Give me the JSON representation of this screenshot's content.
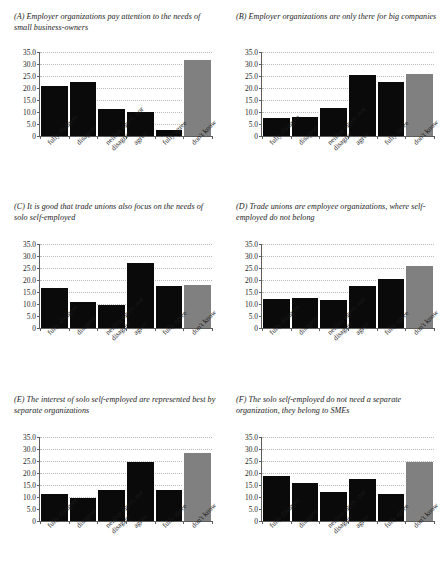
{
  "figure": {
    "background": "#ffffff",
    "bar_color_dark": "#0a0a0a",
    "bar_color_gray": "#808080",
    "gridline_color": "#b9b9b9",
    "axis_color": "#5d5d5d"
  },
  "chart_data": [
    {
      "type": "bar",
      "panel": "A",
      "tag": "(A)",
      "title": "(A) Employer organizations pay attention to the needs of small business-owners",
      "title_text": "Employer organizations pay attention to the needs of small business-owners",
      "categories": [
        "fully disagree",
        "disagree",
        "neither agree, nor disagree",
        "agree",
        "fully agree",
        "don't know"
      ],
      "values": [
        21.0,
        22.4,
        11.4,
        10.2,
        2.7,
        31.5
      ],
      "bar_colors": [
        "#0a0a0a",
        "#0a0a0a",
        "#0a0a0a",
        "#0a0a0a",
        "#0a0a0a",
        "#808080"
      ],
      "xlabel": "",
      "ylabel": "",
      "ylim": [
        0,
        35
      ],
      "yticks": [
        "0",
        "5.0",
        "10.0",
        "15.0",
        "20.0",
        "25.0",
        "30.0",
        "35.0"
      ],
      "ytick_values": [
        0,
        5,
        10,
        15,
        20,
        25,
        30,
        35
      ],
      "grid": true,
      "legend": "none"
    },
    {
      "type": "bar",
      "panel": "B",
      "tag": "(B)",
      "title": "(B) Employer organizations are only there for big companies",
      "title_text": "Employer organizations are only there for big companies",
      "categories": [
        "fully disagree",
        "disagree",
        "neither agree, nor disagree",
        "agree",
        "fully agree",
        "don't know"
      ],
      "values": [
        7.3,
        7.8,
        11.5,
        25.5,
        22.3,
        25.8
      ],
      "bar_colors": [
        "#0a0a0a",
        "#0a0a0a",
        "#0a0a0a",
        "#0a0a0a",
        "#0a0a0a",
        "#808080"
      ],
      "xlabel": "",
      "ylabel": "",
      "ylim": [
        0,
        35
      ],
      "yticks": [
        "0",
        "5.0",
        "10.0",
        "15.0",
        "20.0",
        "25.0",
        "30.0",
        "35.0"
      ],
      "ytick_values": [
        0,
        5,
        10,
        15,
        20,
        25,
        30,
        35
      ],
      "grid": true,
      "legend": "none"
    },
    {
      "type": "bar",
      "panel": "C",
      "tag": "(C)",
      "title": "(C) It is good that trade unions also focus on the needs of solo self-employed",
      "title_text": "It is good that trade unions also focus on the needs of solo self-employed",
      "categories": [
        "fully disagree",
        "disagree",
        "neither agree, nor disagree",
        "agree",
        "fully agree",
        "don't know"
      ],
      "values": [
        16.6,
        10.8,
        9.4,
        27.2,
        17.6,
        17.9
      ],
      "bar_colors": [
        "#0a0a0a",
        "#0a0a0a",
        "#0a0a0a",
        "#0a0a0a",
        "#0a0a0a",
        "#808080"
      ],
      "xlabel": "",
      "ylabel": "",
      "ylim": [
        0,
        35
      ],
      "yticks": [
        "0",
        "5.0",
        "10.0",
        "15.0",
        "20.0",
        "25.0",
        "30.0",
        "35.0"
      ],
      "ytick_values": [
        0,
        5,
        10,
        15,
        20,
        25,
        30,
        35
      ],
      "grid": true,
      "legend": "none"
    },
    {
      "type": "bar",
      "panel": "D",
      "tag": "(D)",
      "title": "(D) Trade unions are employee organizations, where self-employed do not belong",
      "title_text": "Trade unions are employee organizations, where self-employed do not belong",
      "categories": [
        "fully disagree",
        "disagree",
        "neither agree, nor disagree",
        "agree",
        "fully agree",
        "don't know"
      ],
      "values": [
        12.2,
        12.7,
        11.7,
        17.6,
        20.3,
        25.8
      ],
      "bar_colors": [
        "#0a0a0a",
        "#0a0a0a",
        "#0a0a0a",
        "#0a0a0a",
        "#0a0a0a",
        "#808080"
      ],
      "xlabel": "",
      "ylabel": "",
      "ylim": [
        0,
        35
      ],
      "yticks": [
        "0",
        "5.0",
        "10.0",
        "15.0",
        "20.0",
        "25.0",
        "30.0",
        "35.0"
      ],
      "ytick_values": [
        0,
        5,
        10,
        15,
        20,
        25,
        30,
        35
      ],
      "grid": true,
      "legend": "none"
    },
    {
      "type": "bar",
      "panel": "E",
      "tag": "(E)",
      "title": "(E) The interest of solo self-employed are represented best by separate organizations",
      "title_text": "The interest of solo self-employed are represented best by separate organizations",
      "categories": [
        "fully disagree",
        "disagree",
        "neither agree, nor disagree",
        "agree",
        "fully agree",
        "don't know"
      ],
      "values": [
        11.3,
        9.4,
        12.8,
        24.6,
        13.1,
        28.3
      ],
      "bar_colors": [
        "#0a0a0a",
        "#0a0a0a",
        "#0a0a0a",
        "#0a0a0a",
        "#0a0a0a",
        "#808080"
      ],
      "xlabel": "",
      "ylabel": "",
      "ylim": [
        0,
        35
      ],
      "yticks": [
        "0",
        "5.0",
        "10.0",
        "15.0",
        "20.0",
        "25.0",
        "30.0",
        "35.0"
      ],
      "ytick_values": [
        0,
        5,
        10,
        15,
        20,
        25,
        30,
        35
      ],
      "grid": true,
      "legend": "none"
    },
    {
      "type": "bar",
      "panel": "F",
      "tag": "(F)",
      "title": "(F) The solo self-employed do not need a separate organization, they belong to SMEs",
      "title_text": "The solo self-employed do not need a separate organization, they belong to SMEs",
      "categories": [
        "fully disagree",
        "disagree",
        "neither agree, nor disagree",
        "agree",
        "fully agree",
        "don't know"
      ],
      "values": [
        18.8,
        15.8,
        12.0,
        17.6,
        11.4,
        24.4
      ],
      "bar_colors": [
        "#0a0a0a",
        "#0a0a0a",
        "#0a0a0a",
        "#0a0a0a",
        "#0a0a0a",
        "#808080"
      ],
      "xlabel": "",
      "ylabel": "",
      "ylim": [
        0,
        35
      ],
      "yticks": [
        "0",
        "5.0",
        "10.0",
        "15.0",
        "20.0",
        "25.0",
        "30.0",
        "35.0"
      ],
      "ytick_values": [
        0,
        5,
        10,
        15,
        20,
        25,
        30,
        35
      ],
      "grid": true,
      "legend": "none"
    }
  ]
}
